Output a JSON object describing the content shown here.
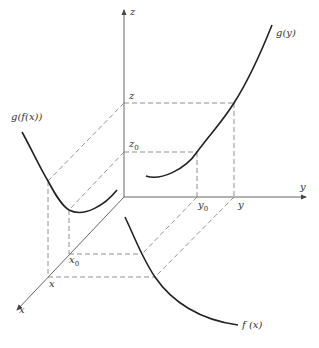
{
  "diagram": {
    "axes": {
      "x": "x",
      "y": "y",
      "z": "z"
    },
    "labels": {
      "z_axis": "z",
      "y_axis": "y",
      "x_axis": "x",
      "z_level": "z",
      "z0_level": "z",
      "z0_sub": "0",
      "y0_tick": "y",
      "y0_sub": "0",
      "y_tick": "y",
      "x0_tick": "x",
      "x0_sub": "0",
      "x_tick": "x",
      "curve_gy": "g(y)",
      "curve_gfx": "g(f(x))",
      "curve_fx": "f (x)"
    },
    "colors": {
      "curve": "#222222",
      "axis": "#555555",
      "dashed": "#777777"
    }
  }
}
